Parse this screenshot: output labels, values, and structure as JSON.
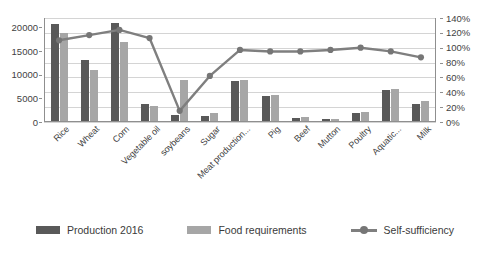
{
  "chart_data": {
    "type": "bar",
    "title": "",
    "subtitle": "",
    "xlabel": "",
    "ylabel": "",
    "y2label": "",
    "grid": true,
    "legend_position": "bottom",
    "categories": [
      "Rice",
      "Wheat",
      "Corn",
      "Vegetable oil",
      "soybeans",
      "Sugar",
      "Meat production...",
      "Pig",
      "Beef",
      "Mutton",
      "Poultry",
      "Aquatic...",
      "Milk"
    ],
    "ylim": [
      0,
      22000
    ],
    "yticks": [
      0,
      5000,
      10000,
      15000,
      20000
    ],
    "ytick_labels": [
      "0",
      "5000",
      "10000",
      "15000",
      "20000"
    ],
    "y2lim": [
      0,
      140
    ],
    "y2ticks": [
      0,
      20,
      40,
      60,
      80,
      100,
      120,
      140
    ],
    "y2tick_labels": [
      "0%",
      "20%",
      "40%",
      "60%",
      "80%",
      "100%",
      "120%",
      "140%"
    ],
    "series": [
      {
        "name": "Production 2016",
        "type": "bar",
        "axis": "left",
        "color": "#595959",
        "values": [
          20600,
          12900,
          20800,
          3500,
          1300,
          1000,
          8500,
          5300,
          700,
          440,
          1800,
          6500,
          3500
        ]
      },
      {
        "name": "Food requirements",
        "type": "bar",
        "axis": "left",
        "color": "#a6a6a6",
        "values": [
          18700,
          10700,
          16800,
          3200,
          8700,
          1600,
          8600,
          5500,
          800,
          500,
          1900,
          6700,
          4300
        ]
      },
      {
        "name": "Self-sufficiency",
        "type": "line",
        "axis": "right",
        "color": "#7f7f7f",
        "unit": "%",
        "values": [
          110,
          117,
          124,
          113,
          15,
          62,
          97,
          95,
          95,
          97,
          100,
          95,
          87
        ]
      }
    ]
  },
  "legend": {
    "items": [
      {
        "label": "Production 2016",
        "marker": "bar-swatch-dark"
      },
      {
        "label": "Food requirements",
        "marker": "bar-swatch-light"
      },
      {
        "label": "Self-sufficiency",
        "marker": "line-marker"
      }
    ]
  },
  "colors": {
    "production": "#595959",
    "requirement": "#a6a6a6",
    "line": "#7f7f7f",
    "grid": "#d4d4d4",
    "axis": "#8f8f8f",
    "text": "#3a3a3a",
    "background": "#ffffff"
  }
}
